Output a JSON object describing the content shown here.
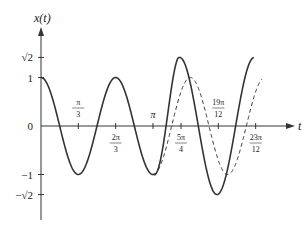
{
  "chart_data": {
    "type": "line",
    "title": "",
    "xlabel": "t",
    "ylabel": "x(t)",
    "xlim": [
      0,
      6.6
    ],
    "ylim": [
      -1.9,
      2.1
    ],
    "grid": false,
    "legend": null,
    "x_ticks": [
      {
        "value": 1.0472,
        "num": "π",
        "den": "3"
      },
      {
        "value": 2.0944,
        "num": "2π",
        "den": "3"
      },
      {
        "value": 3.1416,
        "label": "π"
      },
      {
        "value": 3.927,
        "num": "5π",
        "den": "4"
      },
      {
        "value": 4.9742,
        "num": "19π",
        "den": "12"
      },
      {
        "value": 6.0214,
        "num": "23π",
        "den": "12"
      }
    ],
    "y_ticks": [
      {
        "value": 1.4142,
        "label": "√2"
      },
      {
        "value": 1,
        "label": "1"
      },
      {
        "value": 0,
        "label": "0"
      },
      {
        "value": -1,
        "label": "−1"
      },
      {
        "value": -1.4142,
        "label": "−√2"
      }
    ],
    "series": [
      {
        "name": "solid",
        "style": "solid",
        "description": "x(t) = cos(3t) for 0 ≤ t ≤ π; then larger-amplitude oscillation (peak ≈ √2 near 5π/4, trough ≈ −√2 near 19π/12)",
        "points": [
          [
            0,
            1
          ],
          [
            1.0472,
            -1
          ],
          [
            2.0944,
            1
          ],
          [
            3.1416,
            -1
          ],
          [
            3.83,
            1.35
          ],
          [
            4.97,
            -1.414
          ],
          [
            5.97,
            1.35
          ]
        ]
      },
      {
        "name": "dashed",
        "style": "dashed",
        "description": "continuation of cos(3t) for t ≥ π",
        "points": [
          [
            3.1416,
            -1
          ],
          [
            4.1888,
            1
          ],
          [
            5.236,
            -1
          ],
          [
            6.2832,
            1
          ]
        ]
      }
    ]
  }
}
